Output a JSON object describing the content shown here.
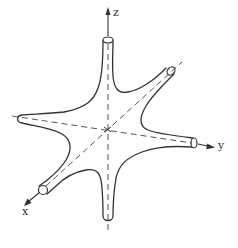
{
  "figure": {
    "type": "diagram",
    "axes": {
      "z": {
        "label": "z"
      },
      "y": {
        "label": "y"
      },
      "x": {
        "label": "x"
      }
    },
    "colors": {
      "stroke": "#333333",
      "background": "#ffffff"
    }
  }
}
